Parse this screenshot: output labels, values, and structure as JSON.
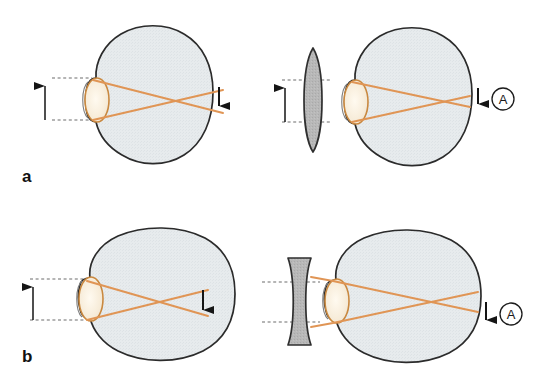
{
  "figure": {
    "background_color": "#ffffff",
    "panels": [
      {
        "id": "a-uncorrected",
        "letter": "",
        "label": "hyperopic eye uncorrected",
        "condition": "hyperopia",
        "eye_shape": "short axial length (tall oval)",
        "lens_present": false,
        "focal_point": "behind the retina",
        "marker": ""
      },
      {
        "id": "a-corrected",
        "letter": "",
        "label": "hyperopic eye corrected with convex lens",
        "condition": "hyperopia corrected",
        "eye_shape": "short axial length (tall oval)",
        "lens_present": true,
        "lens_type": "biconvex converging lens",
        "focal_point": "on the retina",
        "marker": "A"
      },
      {
        "id": "b-uncorrected",
        "letter": "",
        "label": "myopic eye uncorrected",
        "condition": "myopia",
        "eye_shape": "long axial length (wide oval)",
        "lens_present": false,
        "focal_point": "in front of the retina",
        "marker": ""
      },
      {
        "id": "b-corrected",
        "letter": "",
        "label": "myopic eye corrected with concave lens",
        "condition": "myopia corrected",
        "eye_shape": "long axial length (wide oval)",
        "lens_present": true,
        "lens_type": "biconcave diverging lens",
        "focal_point": "on the retina",
        "marker": "A"
      }
    ],
    "row_labels": {
      "top": "a",
      "bottom": "b"
    },
    "annotations": {
      "marker_top_right": "A",
      "marker_bottom_right": "A"
    },
    "colors": {
      "eye_fill": "#e7ebed",
      "eye_outline": "#2b2b2b",
      "eye_lens_fill": "#f8eedd",
      "eye_lens_outline": "#c98a4b",
      "ray_color": "#e09555",
      "spectacle_lens_fill": "#b6b6b6",
      "spectacle_lens_outline": "#3a3a3a",
      "arrow_color": "#151515",
      "dashed_line_color": "#6d6d6d",
      "text_color": "#111111"
    }
  }
}
